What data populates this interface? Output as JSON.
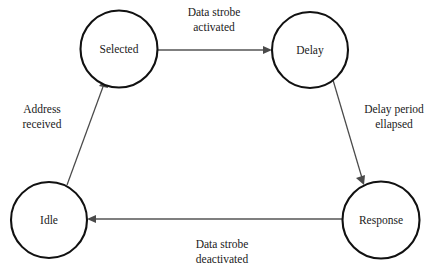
{
  "diagram": {
    "type": "state-transition-diagram",
    "background_color": "#ffffff",
    "stroke_color": "#111111",
    "line_color": "#4a4a4a",
    "text_color": "#1a1a1a",
    "states": [
      {
        "id": "selected",
        "label": "Selected",
        "cx": 119,
        "cy": 49,
        "r": 38.5
      },
      {
        "id": "delay",
        "label": "Delay",
        "cx": 310,
        "cy": 50,
        "r": 38.0
      },
      {
        "id": "idle",
        "label": "Idle",
        "cx": 49,
        "cy": 220,
        "r": 38.0
      },
      {
        "id": "response",
        "label": "Response",
        "cx": 381,
        "cy": 220,
        "r": 38.5
      }
    ],
    "transitions": [
      {
        "id": "selected-to-delay",
        "from": "selected",
        "to": "delay",
        "label_line1": "Data strobe",
        "label_line2": "activated",
        "label_x": 214,
        "label_y1": 16,
        "label_y2": 31
      },
      {
        "id": "delay-to-response",
        "from": "delay",
        "to": "response",
        "label_line1": "Delay period",
        "label_line2": "ellapsed",
        "label_x": 394,
        "label_y1": 113,
        "label_y2": 128
      },
      {
        "id": "response-to-idle",
        "from": "response",
        "to": "idle",
        "label_line1": "Data strobe",
        "label_line2": "deactivated",
        "label_x": 222,
        "label_y1": 248,
        "label_y2": 263
      },
      {
        "id": "idle-to-selected",
        "from": "idle",
        "to": "selected",
        "label_line1": "Address",
        "label_line2": "received",
        "label_x": 42,
        "label_y1": 113,
        "label_y2": 128
      }
    ]
  }
}
